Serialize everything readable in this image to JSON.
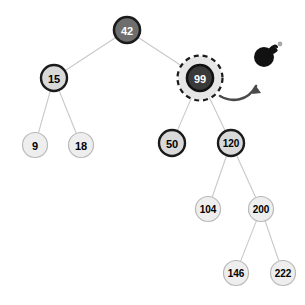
{
  "diagram": {
    "type": "binary-search-tree",
    "width": 305,
    "height": 305,
    "background": "#ffffff"
  },
  "colors": {
    "root_fill": "#6e6e6e",
    "root_stroke": "#1b1b1b",
    "root_text": "#ffffff",
    "highlight_fill": "#3a3a3a",
    "highlight_stroke": "#111111",
    "highlight_text": "#ffffff",
    "mid_fill": "#d9d9d9",
    "mid_stroke": "#1b1b1b",
    "mid_text": "#000000",
    "leaf_fill": "#eeeeee",
    "leaf_stroke": "#b9b9b9",
    "leaf_text": "#000000",
    "edge": "#c9c9c9",
    "halo_fill": "#e6e6e6",
    "dashed_stroke": "#1b1b1b",
    "arrow": "#4a4a4a",
    "bomb_body": "#111111",
    "bomb_spark": "#a8a8a8"
  },
  "nodes": [
    {
      "id": "n42",
      "label": "42",
      "cx": 127,
      "cy": 30,
      "r": 13,
      "style": "root",
      "font_size": 11
    },
    {
      "id": "n15",
      "label": "15",
      "cx": 54,
      "cy": 78,
      "r": 13,
      "style": "mid",
      "font_size": 11
    },
    {
      "id": "n99",
      "label": "99",
      "cx": 200,
      "cy": 78,
      "r": 13,
      "style": "highlight",
      "font_size": 11
    },
    {
      "id": "n9",
      "label": "9",
      "cx": 35,
      "cy": 145,
      "r": 12.5,
      "style": "leaf",
      "font_size": 11
    },
    {
      "id": "n18",
      "label": "18",
      "cx": 81,
      "cy": 145,
      "r": 12.5,
      "style": "leaf",
      "font_size": 11
    },
    {
      "id": "n50",
      "label": "50",
      "cx": 172,
      "cy": 143,
      "r": 13,
      "style": "mid",
      "font_size": 11
    },
    {
      "id": "n120",
      "label": "120",
      "cx": 231,
      "cy": 143,
      "r": 13,
      "style": "mid",
      "font_size": 10
    },
    {
      "id": "n104",
      "label": "104",
      "cx": 208,
      "cy": 209,
      "r": 12.5,
      "style": "leaf",
      "font_size": 10
    },
    {
      "id": "n200",
      "label": "200",
      "cx": 261,
      "cy": 209,
      "r": 12.5,
      "style": "leaf",
      "font_size": 10
    },
    {
      "id": "n146",
      "label": "146",
      "cx": 236,
      "cy": 273,
      "r": 12.5,
      "style": "leaf",
      "font_size": 10
    },
    {
      "id": "n222",
      "label": "222",
      "cx": 283,
      "cy": 273,
      "r": 12.5,
      "style": "leaf",
      "font_size": 10
    }
  ],
  "edges": [
    {
      "id": "e-42-15",
      "from": "n42",
      "to": "n15"
    },
    {
      "id": "e-42-99",
      "from": "n42",
      "to": "n99"
    },
    {
      "id": "e-15-9",
      "from": "n15",
      "to": "n9"
    },
    {
      "id": "e-15-18",
      "from": "n15",
      "to": "n18"
    },
    {
      "id": "e-99-50",
      "from": "n99",
      "to": "n50"
    },
    {
      "id": "e-99-120",
      "from": "n99",
      "to": "n120"
    },
    {
      "id": "e-120-104",
      "from": "n120",
      "to": "n104"
    },
    {
      "id": "e-120-200",
      "from": "n120",
      "to": "n200"
    },
    {
      "id": "e-200-146",
      "from": "n200",
      "to": "n146"
    },
    {
      "id": "e-200-222",
      "from": "n200",
      "to": "n222"
    }
  ],
  "selection": {
    "target_node": "n99",
    "halo_radius": 22,
    "dash_radius": 22.5,
    "dash_pattern": "5 4",
    "dash_width": 2.2
  },
  "annotation": {
    "arrow": {
      "path": "M 220 96 C 232 103, 248 101, 256 86",
      "head": "M 256 86 L 252 94 L 261 93 Z"
    },
    "bomb": {
      "cx": 264,
      "cy": 57,
      "r": 10,
      "fuse_path": "M 270 49 C 273 45, 276 45, 277 47",
      "cap_x": 271,
      "cap_y": 47,
      "cap_w": 6,
      "cap_h": 6,
      "spark_cx": 280,
      "spark_cy": 44,
      "spark_r": 2.4
    }
  }
}
